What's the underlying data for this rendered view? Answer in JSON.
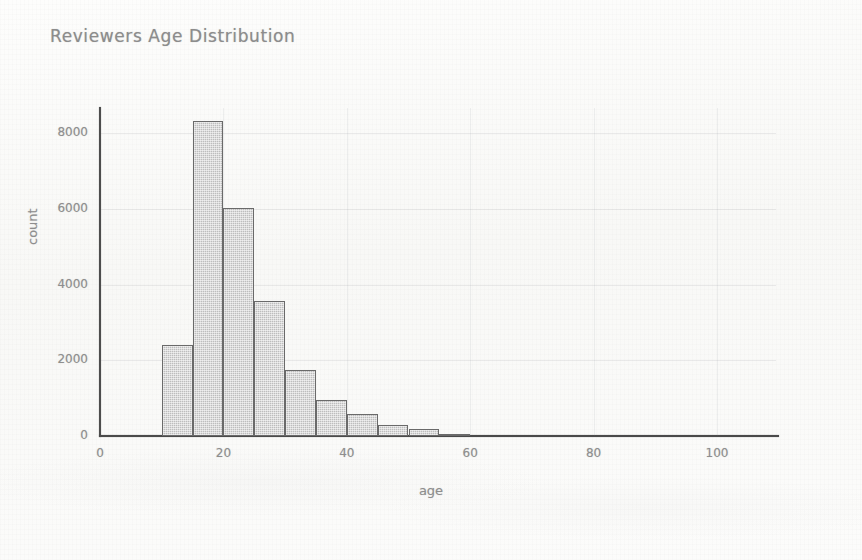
{
  "chart_data": {
    "type": "bar",
    "title": "Reviewers Age Distribution",
    "xlabel": "age",
    "ylabel": "count",
    "xlim": [
      0,
      105
    ],
    "ylim": [
      0,
      8800
    ],
    "grid": true,
    "legend": "none",
    "bin_width": 5,
    "categories": [
      "10-15",
      "15-20",
      "20-25",
      "25-30",
      "30-35",
      "35-40",
      "40-45",
      "45-50",
      "50-55",
      "55-60"
    ],
    "bin_starts": [
      10,
      15,
      20,
      25,
      30,
      35,
      40,
      45,
      50,
      55
    ],
    "values": [
      2400,
      8320,
      6020,
      3560,
      1740,
      950,
      580,
      290,
      185,
      60
    ],
    "x_ticks": [
      0,
      20,
      40,
      60,
      80,
      100
    ],
    "x_tick_labels": [
      "0",
      "20",
      "40",
      "60",
      "80",
      "100"
    ],
    "y_ticks": [
      0,
      2000,
      4000,
      6000,
      8000
    ],
    "y_tick_labels": [
      "0",
      "2000",
      "4000",
      "6000",
      "8000"
    ],
    "colors": {
      "bar_fill": "#bdbdbd",
      "bar_edge": "#6a6a6a",
      "axis": "#4a4a4a",
      "text": "#8e8e8e",
      "title": "#8c8c8c",
      "background": "#fbfbfa",
      "gridline": "#dfe1e5"
    }
  }
}
